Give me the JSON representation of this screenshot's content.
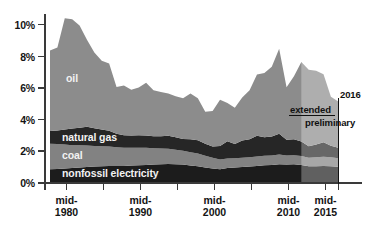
{
  "chart_data": {
    "type": "area",
    "title": "",
    "subtitle": "",
    "xlabel": "",
    "ylabel": "",
    "stacked": true,
    "grid": false,
    "legend_position": "in-plot",
    "xlim": [
      1977,
      2016.5
    ],
    "ylim": [
      0,
      11
    ],
    "y_ticks": [
      "0%",
      "2%",
      "4%",
      "6%",
      "8%",
      "10%"
    ],
    "y_tick_values": [
      0,
      2,
      4,
      6,
      8,
      10
    ],
    "x_ticks": [
      "mid-\n1980",
      "mid-\n1990",
      "mid-\n2000",
      "mid-\n2010",
      "mid-\n2015"
    ],
    "x_tick_labels": [
      {
        "line1": "mid-",
        "line2": "1980",
        "value": 1980
      },
      {
        "line1": "mid-",
        "line2": "1990",
        "value": 1990
      },
      {
        "line1": "mid-",
        "line2": "2000",
        "value": 2000
      },
      {
        "line1": "mid-",
        "line2": "2010",
        "value": 2010
      },
      {
        "line1": "mid-",
        "line2": "2015",
        "value": 2015
      }
    ],
    "x_minor_ticks": [
      1980,
      1985,
      1990,
      1995,
      2000,
      2005,
      2010,
      2015,
      2016
    ],
    "x": [
      1977,
      1978,
      1979,
      1980,
      1981,
      1982,
      1983,
      1984,
      1985,
      1986,
      1987,
      1988,
      1989,
      1990,
      1991,
      1992,
      1993,
      1994,
      1995,
      1996,
      1997,
      1998,
      1999,
      2000,
      2001,
      2002,
      2003,
      2004,
      2005,
      2006,
      2007,
      2008,
      2009,
      2010,
      2011,
      2012,
      2013,
      2014,
      2015,
      2016
    ],
    "series": [
      {
        "name": "nonfossil electricity",
        "color": "#1c1c1c",
        "values": [
          0.8,
          0.82,
          0.85,
          0.88,
          0.92,
          0.95,
          0.98,
          1.0,
          1.02,
          1.02,
          1.02,
          1.04,
          1.06,
          1.08,
          1.1,
          1.12,
          1.14,
          1.12,
          1.1,
          1.05,
          1.0,
          0.92,
          0.85,
          0.8,
          0.88,
          0.92,
          0.95,
          0.98,
          1.02,
          1.06,
          1.08,
          1.12,
          1.1,
          1.12,
          1.08,
          1.0,
          1.0,
          1.02,
          1.0,
          0.96
        ]
      },
      {
        "name": "coal",
        "color": "#828282",
        "values": [
          1.62,
          1.58,
          1.52,
          1.45,
          1.4,
          1.36,
          1.3,
          1.26,
          1.22,
          1.18,
          1.14,
          1.12,
          1.1,
          1.08,
          1.04,
          1.0,
          0.96,
          0.92,
          0.88,
          0.84,
          0.8,
          0.74,
          0.68,
          0.62,
          0.6,
          0.58,
          0.58,
          0.58,
          0.6,
          0.6,
          0.6,
          0.62,
          0.58,
          0.58,
          0.56,
          0.54,
          0.56,
          0.58,
          0.56,
          0.54
        ]
      },
      {
        "name": "natural gas",
        "color": "#262626",
        "values": [
          0.8,
          0.86,
          0.95,
          1.05,
          1.12,
          1.18,
          1.12,
          1.06,
          1.0,
          0.86,
          0.8,
          0.78,
          0.8,
          0.78,
          0.76,
          0.78,
          0.82,
          0.8,
          0.74,
          0.82,
          0.84,
          0.76,
          0.72,
          0.86,
          1.1,
          0.9,
          1.1,
          1.14,
          1.3,
          1.18,
          1.2,
          1.32,
          1.0,
          1.0,
          0.92,
          0.72,
          0.82,
          0.92,
          0.74,
          0.66
        ]
      },
      {
        "name": "oil",
        "color": "#8c8c8c",
        "values": [
          5.1,
          5.25,
          7.05,
          6.92,
          6.46,
          5.51,
          4.8,
          4.36,
          4.26,
          2.96,
          3.14,
          2.9,
          3.02,
          3.34,
          2.9,
          2.8,
          2.68,
          2.58,
          2.58,
          2.89,
          2.66,
          2.02,
          2.25,
          2.92,
          2.42,
          2.3,
          2.72,
          3.1,
          3.88,
          4.06,
          4.42,
          5.38,
          3.32,
          4.0,
          5.04,
          4.84,
          4.66,
          4.3,
          3.1,
          2.94
        ]
      }
    ],
    "series_labels": [
      {
        "name": "oil",
        "text": "oil"
      },
      {
        "name": "natural gas",
        "text": "natural gas"
      },
      {
        "name": "coal",
        "text": "coal"
      },
      {
        "name": "nonfossil electricity",
        "text": "nonfossil electricity"
      }
    ],
    "annotations": [
      {
        "name": "extended",
        "text": "extended"
      },
      {
        "name": "preliminary",
        "text": "preliminary"
      },
      {
        "name": "year-2016",
        "text": "2016"
      }
    ],
    "shaded_region": {
      "label": "extended",
      "from": 2011,
      "to": 2016,
      "style": "lightened overlay"
    }
  },
  "axis": {
    "y_labels": [
      "10%",
      "8%",
      "6%",
      "4%",
      "2%",
      "0%"
    ],
    "x_labels": [
      {
        "line1": "mid-",
        "line2": "1980"
      },
      {
        "line1": "mid-",
        "line2": "1990"
      },
      {
        "line1": "mid-",
        "line2": "2000"
      },
      {
        "line1": "mid-",
        "line2": "2010"
      },
      {
        "line1": "mid-",
        "line2": "2015"
      }
    ]
  },
  "annotations": {
    "extended": "extended",
    "preliminary": "preliminary",
    "year_marker": "2016"
  },
  "colors": {
    "oil": "#8c8c8c",
    "natural_gas": "#262626",
    "coal": "#828282",
    "nonfossil_electricity": "#1c1c1c",
    "axis": "#3a3a3a",
    "text": "#141414",
    "label_text": "#f2f2f2"
  }
}
